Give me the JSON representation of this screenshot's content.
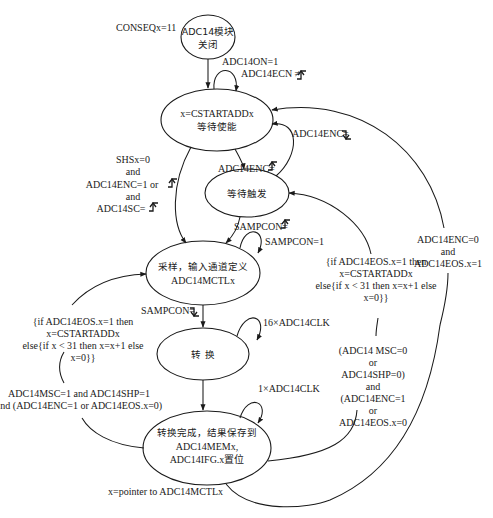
{
  "diagram": {
    "mode_label": "CONSEQx=11",
    "colors": {
      "line": "#1a1a1a",
      "background": "#ffffff"
    },
    "states": [
      {
        "id": "off",
        "lines": [
          "ADC14模块",
          "关闭"
        ]
      },
      {
        "id": "wait_enable",
        "lines": [
          "x=CSTARTADDx",
          "等待使能"
        ]
      },
      {
        "id": "wait_trigger",
        "lines": [
          "等待触发"
        ]
      },
      {
        "id": "sample",
        "lines": [
          "采样，输入通道定义",
          "ADC14MCTLx"
        ]
      },
      {
        "id": "convert",
        "lines": [
          "转  换"
        ]
      },
      {
        "id": "done",
        "lines": [
          "转换完成，结果保存到",
          "ADC14MEMx,",
          "ADC14IFG.x置位"
        ]
      }
    ],
    "transitions": {
      "off_to_wait_enable": {
        "lines": [
          "ADC14ON=1"
        ]
      },
      "wait_enable_self": {
        "lines": [
          "ADC14ECN ≠"
        ],
        "signal": "rising-edge"
      },
      "wait_enable_to_wait_trigger": {
        "lines": [
          "ADC14ENC="
        ],
        "signal": "rising-edge"
      },
      "wait_trigger_to_wait_enable": {
        "lines": [
          "ADC14ENC="
        ],
        "signal": "falling-edge"
      },
      "wait_enable_to_sample": {
        "lines": [
          "SHSx=0",
          "and",
          "ADC14ENC=1 or",
          "and",
          "ADC14SC="
        ],
        "signals": [
          "rising-edge",
          "rising-edge"
        ]
      },
      "wait_trigger_to_sample": {
        "lines": [
          "SAMPCON="
        ],
        "signal": "rising-edge"
      },
      "sample_self": {
        "lines": [
          "SAMPCON=1"
        ]
      },
      "sample_to_convert": {
        "lines": [
          "SAMPCON="
        ],
        "signal": "falling-edge"
      },
      "convert_self": {
        "lines": [
          "16×ADC14CLK"
        ]
      },
      "done_self": {
        "lines": [
          "1×ADC14CLK"
        ]
      },
      "done_to_wait_trigger": {
        "lines": [
          "{if ADC14EOS.x=1 then",
          "x=CSTARTADDx",
          "else{if x < 31 then x=x+1 else",
          "x=0}}"
        ]
      },
      "done_to_wait_trigger_condition": {
        "lines": [
          "(ADC14 MSC=0",
          "or",
          "ADC14SHP=0)",
          "and",
          "(ADC14ENC=1",
          "or",
          "ADC14EOS.x=0"
        ]
      },
      "done_to_sample": {
        "lines": [
          "{if ADC14EOS.x=1 then",
          "x=CSTARTADDx",
          "else{if x < 31 then x=x+1 else",
          "x=0}}"
        ]
      },
      "done_to_sample_condition": {
        "lines": [
          "ADC14MSC=1 and ADC14SHP=1",
          "and (ADC14ENC=1 or ADC14EOS.x=0)"
        ]
      },
      "done_to_wait_enable": {
        "lines": [
          "ADC14ENC=0",
          "and",
          "ADC14EOS.x=1"
        ]
      },
      "done_footer": {
        "lines": [
          "x=pointer to ADC14MCTLx"
        ]
      }
    }
  }
}
